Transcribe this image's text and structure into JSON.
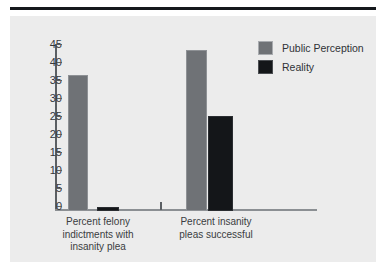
{
  "chart_data": {
    "type": "bar",
    "title": "",
    "subtitle": "",
    "xlabel": "",
    "ylabel": "",
    "ylim": [
      0,
      45
    ],
    "ytick_labels": [
      "45",
      "40",
      "35",
      "30",
      "25",
      "20",
      "15",
      "10",
      "5",
      "0"
    ],
    "ytick_values": [
      45,
      40,
      35,
      30,
      25,
      20,
      15,
      10,
      5,
      0
    ],
    "grid": false,
    "legend_position": "top-right",
    "categories": [
      "Percent felony indictments with insanity plea",
      "Percent insanity pleas successful"
    ],
    "category_lines": [
      [
        "Percent felony",
        "indictments with",
        "insanity plea"
      ],
      [
        "Percent insanity",
        "pleas successful"
      ]
    ],
    "series": [
      {
        "name": "Public Perception",
        "color": "#6f7276",
        "values": [
          37,
          44
        ]
      },
      {
        "name": "Reality",
        "color": "#141619",
        "values": [
          1,
          26
        ]
      }
    ]
  },
  "legend": {
    "items": [
      {
        "label": "Public Perception",
        "swatch": "public-perception-swatch"
      },
      {
        "label": "Reality",
        "swatch": "reality-swatch"
      }
    ]
  },
  "colors": {
    "panel_background": "#ececec",
    "page_background": "#ffffff",
    "rule": "#15181c",
    "axis": "#5b5f63",
    "text": "#35383c",
    "public_perception": "#6f7276",
    "reality": "#141619"
  }
}
